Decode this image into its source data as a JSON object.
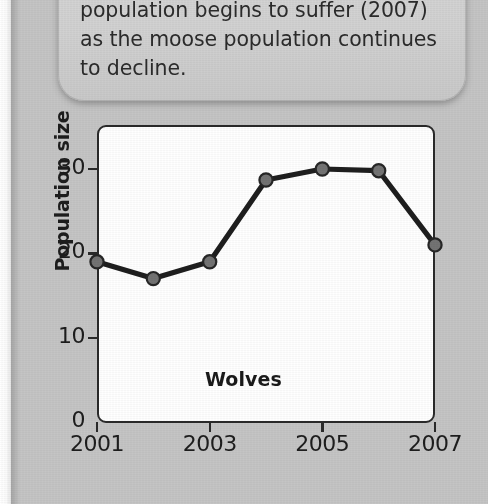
{
  "page": {
    "background_color": "#c5c5c5",
    "paper_edge_color": "#ffffff"
  },
  "callout": {
    "name": "text-callout-box",
    "background_color": "#d2d2d2",
    "lines": [
      "population begins to suffer (2007)",
      "as the moose population continues",
      "to decline."
    ]
  },
  "chart_data": {
    "type": "line",
    "title": "",
    "series_label": "Wolves",
    "xlabel": "",
    "ylabel": "Population size",
    "x": [
      2001,
      2002,
      2003,
      2004,
      2005,
      2006,
      2007
    ],
    "values": [
      19,
      17,
      19,
      28.7,
      30,
      29.8,
      21
    ],
    "series": [
      {
        "name": "Wolves",
        "values": [
          19,
          17,
          19,
          28.7,
          30,
          29.8,
          21
        ]
      }
    ],
    "xlim": [
      2001,
      2007
    ],
    "ylim": [
      0,
      33.5
    ],
    "xticks": [
      2001,
      2003,
      2005,
      2007
    ],
    "xtick_labels": [
      "2001",
      "2003",
      "2005",
      "2007"
    ],
    "yticks": [
      0,
      10,
      20,
      30
    ],
    "ytick_labels": [
      "0",
      "10",
      "20",
      "30"
    ],
    "grid": false,
    "legend": "none",
    "line_color": "#1e1e1e",
    "marker_color": "#737373",
    "marker_edge_color": "#262626",
    "plot_background": "#ffffff",
    "axis_color": "#2a2a2a"
  }
}
